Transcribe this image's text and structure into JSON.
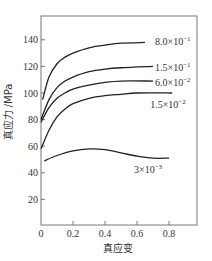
{
  "chart_data": {
    "type": "line",
    "title": "",
    "xlabel": "真应变",
    "ylabel": "真应力 /MPa",
    "xlim": [
      0,
      0.975
    ],
    "ylim": [
      0,
      160
    ],
    "xticks": [
      0,
      0.2,
      0.4,
      0.6,
      0.8
    ],
    "xtick_labels": [
      "0",
      "0.2",
      "0.4",
      "0.6",
      "0.8"
    ],
    "yticks": [
      20,
      40,
      60,
      80,
      100,
      120,
      140
    ],
    "ytick_labels": [
      "20",
      "40",
      "60",
      "80",
      "100",
      "120",
      "140"
    ],
    "grid": false,
    "legend": "inline labels at curve ends",
    "series": [
      {
        "name": "8.0×10⁻¹",
        "label_base": "8.0×10",
        "label_exp": "−1",
        "x": [
          0.01,
          0.05,
          0.1,
          0.15,
          0.2,
          0.3,
          0.4,
          0.5,
          0.65
        ],
        "y": [
          95,
          112,
          122,
          127,
          130,
          134,
          136,
          137.5,
          138
        ]
      },
      {
        "name": "1.5×10⁻¹",
        "label_base": "1.5×10",
        "label_exp": "−1",
        "x": [
          0.0,
          0.05,
          0.1,
          0.15,
          0.2,
          0.3,
          0.4,
          0.5,
          0.7
        ],
        "y": [
          80,
          95,
          104,
          109,
          112,
          116,
          118,
          119,
          120
        ]
      },
      {
        "name": "6.0×10⁻²",
        "label_base": "6.0×10",
        "label_exp": "−2",
        "x": [
          0.0,
          0.05,
          0.1,
          0.15,
          0.2,
          0.3,
          0.4,
          0.5,
          0.7
        ],
        "y": [
          78,
          89,
          96,
          100,
          103,
          106,
          108,
          109,
          109
        ]
      },
      {
        "name": "1.5×10⁻²",
        "label_base": "1.5×10",
        "label_exp": "−2",
        "x": [
          0.0,
          0.05,
          0.1,
          0.15,
          0.2,
          0.3,
          0.4,
          0.5,
          0.6,
          0.82
        ],
        "y": [
          58,
          72,
          82,
          88,
          92,
          96,
          98,
          99,
          100,
          100
        ]
      },
      {
        "name": "3×10⁻³",
        "label_base": "3×10",
        "label_exp": "−3",
        "x": [
          0.02,
          0.1,
          0.2,
          0.3,
          0.4,
          0.5,
          0.6,
          0.7,
          0.8
        ],
        "y": [
          49,
          53,
          56.5,
          58,
          57.5,
          55,
          52.5,
          51,
          51
        ]
      }
    ]
  }
}
